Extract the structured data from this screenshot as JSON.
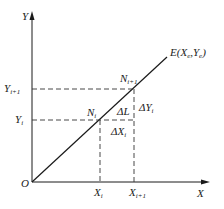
{
  "diagram": {
    "type": "linear-interpolation",
    "colors": {
      "line": "#1a1a1a",
      "dashed": "#333333",
      "text": "#222222",
      "background": "#ffffff"
    },
    "axes": {
      "x_label": "X",
      "y_label": "Y",
      "origin_label": "O"
    },
    "endpoint": {
      "label": "E",
      "coords": "(X",
      "xsub": "e",
      "mid": ",Y",
      "ysub": "e",
      "close": ")"
    },
    "points": {
      "n_i": {
        "label": "N",
        "sub": "i"
      },
      "n_i1": {
        "label": "N",
        "sub": "i+1"
      }
    },
    "ticks": {
      "x_i": {
        "label": "X",
        "sub": "i"
      },
      "x_i1": {
        "label": "X",
        "sub": "i+1"
      },
      "y_i": {
        "label": "Y",
        "sub": "i"
      },
      "y_i1": {
        "label": "Y",
        "sub": "i+1"
      }
    },
    "deltas": {
      "dl": "ΔL",
      "dx": {
        "label": "ΔX",
        "sub": "i"
      },
      "dy": {
        "label": "ΔY",
        "sub": "i"
      }
    }
  }
}
